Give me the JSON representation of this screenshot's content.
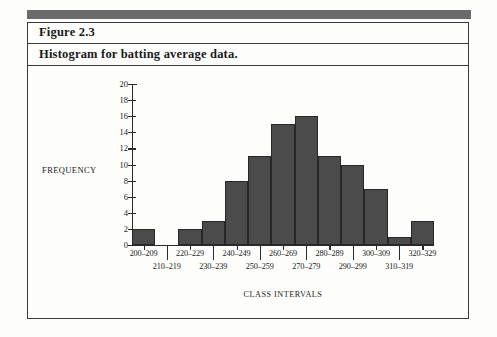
{
  "figure": {
    "number": "Figure 2.3",
    "title": "Histogram for batting average data."
  },
  "colors": {
    "bar_fill": "#4b4b4b",
    "bar_border": "#272727",
    "band": "#6b6b6b",
    "frame": "#3a3a3a",
    "text": "#232323"
  },
  "chart_data": {
    "type": "bar",
    "title": "Histogram for batting average data.",
    "xlabel": "CLASS INTERVALS",
    "ylabel": "FREQUENCY",
    "categories": [
      "200–209",
      "210–219",
      "220–229",
      "230–239",
      "240–249",
      "250–259",
      "260–269",
      "270–279",
      "280–289",
      "290–299",
      "300–309",
      "310–319",
      "320–329"
    ],
    "values": [
      2,
      0,
      2,
      3,
      8,
      11,
      15,
      16,
      11,
      10,
      7,
      1,
      3
    ],
    "ylim": [
      0,
      20
    ],
    "yticks": [
      0,
      2,
      4,
      6,
      8,
      10,
      12,
      14,
      16,
      18,
      20
    ],
    "ytick_labels": [
      "0",
      "2",
      "4",
      "6",
      "8",
      "10",
      "12",
      "14",
      "16",
      "18",
      "20"
    ],
    "grid": false,
    "legend": false
  }
}
